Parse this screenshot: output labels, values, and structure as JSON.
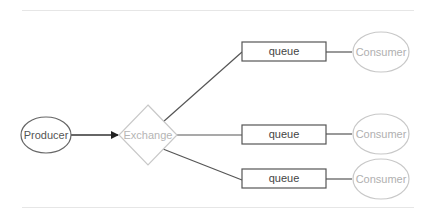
{
  "diagram": {
    "type": "message-broker-fanout",
    "nodes": {
      "producer": {
        "label": "Producer",
        "shape": "ellipse"
      },
      "exchange": {
        "label": "Exchange",
        "shape": "diamond"
      },
      "queues": [
        {
          "label": "queue",
          "shape": "rectangle"
        },
        {
          "label": "queue",
          "shape": "rectangle"
        },
        {
          "label": "queue",
          "shape": "rectangle"
        }
      ],
      "consumers": [
        {
          "label": "Consumer",
          "shape": "ellipse"
        },
        {
          "label": "Consumer",
          "shape": "ellipse"
        },
        {
          "label": "Consumer",
          "shape": "ellipse"
        }
      ]
    },
    "edges": [
      {
        "from": "Producer",
        "to": "Exchange",
        "arrow": true
      },
      {
        "from": "Exchange",
        "to": "queue 1",
        "arrow": false
      },
      {
        "from": "Exchange",
        "to": "queue 2",
        "arrow": false
      },
      {
        "from": "Exchange",
        "to": "queue 3",
        "arrow": false
      },
      {
        "from": "queue 1",
        "to": "Consumer 1",
        "arrow": false
      },
      {
        "from": "queue 2",
        "to": "Consumer 2",
        "arrow": false
      },
      {
        "from": "queue 3",
        "to": "Consumer 3",
        "arrow": false
      }
    ],
    "colors": {
      "stroke_dark": "#555555",
      "stroke_light": "#c8c8c8",
      "text_dark": "#444444",
      "text_light": "#b5b5b5"
    }
  }
}
